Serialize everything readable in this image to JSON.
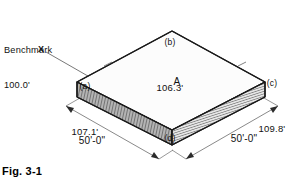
{
  "figure": {
    "caption": "Fig. 3-1",
    "area_label": "A",
    "benchmark": {
      "title": "Benchmark",
      "elevation": "100.0'",
      "marker": "X"
    },
    "corners": [
      {
        "key": "a",
        "tag": "(a)",
        "elevation": "107.1'"
      },
      {
        "key": "b",
        "tag": "(b)",
        "elevation": "106.3'"
      },
      {
        "key": "c",
        "tag": "(c)",
        "elevation": "109.8'"
      },
      {
        "key": "d",
        "tag": "(d)",
        "elevation": "108.4'"
      }
    ],
    "dimensions": [
      {
        "key": "left",
        "value": "50'-0\""
      },
      {
        "key": "right",
        "value": "50'-0\""
      }
    ],
    "colors": {
      "line": "#1a1a1a",
      "top_face": "#fcfcfc",
      "side_face_left": "#8f8f8f",
      "side_face_right": "#cfcfcf",
      "dimension_line": "#6b6b6b",
      "text": "#111111"
    }
  }
}
